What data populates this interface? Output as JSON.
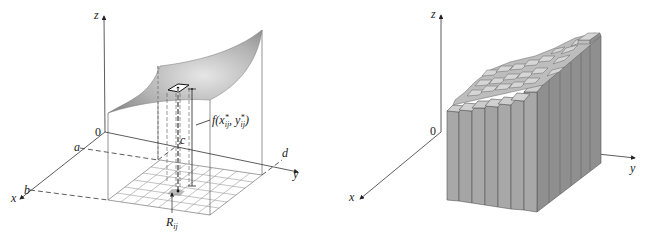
{
  "figures": [
    {
      "id": "left",
      "description": "Surface z = f(x,y) over rectangle R with subrectangle R_ij and sample column",
      "axes": {
        "x_label": "x",
        "y_label": "y",
        "z_label": "z",
        "origin_label": "0"
      },
      "bounds_labels": {
        "a": "a",
        "b": "b",
        "c": "c",
        "d": "d"
      },
      "annotations": {
        "height_label_main": "f(x",
        "height_label_sub1": "ij",
        "height_label_mid": ", y",
        "height_label_sub2": "ij",
        "height_label_end": ")",
        "star": "*",
        "subrect_label_main": "R",
        "subrect_label_sub": "ij"
      },
      "grid": {
        "rows": 6,
        "cols": 8
      }
    },
    {
      "id": "right",
      "description": "Approximating rectangular boxes (columns) under the surface",
      "axes": {
        "x_label": "x",
        "y_label": "y",
        "z_label": "z",
        "origin_label": "0"
      },
      "grid": {
        "rows": 6,
        "cols": 8
      }
    }
  ],
  "colors": {
    "surface_light": "#d9d9d9",
    "surface_dark": "#8e8e8e",
    "box_front": "#a8a8a8",
    "box_side": "#8f8f8f",
    "box_top": "#cfcfcf",
    "line": "#333333",
    "grid": "#9a9a9a"
  }
}
